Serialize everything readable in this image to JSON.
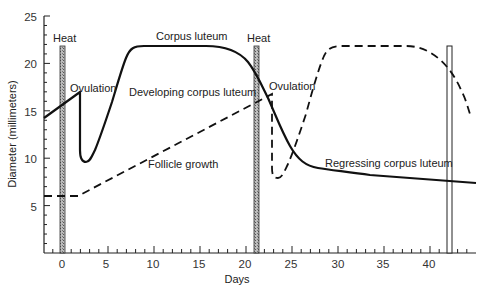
{
  "chart_data": {
    "type": "line",
    "title": "",
    "xlabel": "Days",
    "ylabel": "Diameter (millimeters)",
    "xlim": [
      -2,
      44.5
    ],
    "ylim": [
      0,
      25
    ],
    "x_ticks": [
      0,
      5,
      10,
      15,
      20,
      25,
      30,
      35,
      40
    ],
    "y_ticks": [
      5,
      10,
      15,
      20,
      25
    ],
    "grid": false,
    "series": [
      {
        "name": "Corpus luteum (developing / regressing)",
        "style": "solid",
        "points": [
          [
            -2,
            14.3
          ],
          [
            2,
            16.8
          ],
          [
            2,
            8
          ],
          [
            2.5,
            7.2
          ],
          [
            3.2,
            7.6
          ],
          [
            5,
            12
          ],
          [
            7.5,
            19
          ],
          [
            9,
            21.5
          ],
          [
            11,
            22
          ],
          [
            17,
            22
          ],
          [
            19,
            21
          ],
          [
            21,
            19.5
          ],
          [
            22,
            17.5
          ],
          [
            24,
            13.5
          ],
          [
            26,
            10
          ],
          [
            28,
            8.9
          ],
          [
            32,
            8.3
          ],
          [
            38,
            7.6
          ],
          [
            44,
            6.9
          ]
        ]
      },
      {
        "name": "Follicle growth",
        "style": "dashed",
        "points": [
          [
            -2,
            6
          ],
          [
            1.8,
            6
          ],
          [
            23,
            17
          ],
          [
            23,
            8
          ],
          [
            23.5,
            7.1
          ],
          [
            24.2,
            7.5
          ],
          [
            26,
            12
          ],
          [
            28,
            18.5
          ],
          [
            29.5,
            21.5
          ],
          [
            31,
            22
          ],
          [
            38,
            22
          ],
          [
            41,
            21
          ],
          [
            43,
            19
          ],
          [
            44,
            16.7
          ]
        ]
      }
    ],
    "heat_bars": [
      {
        "label": "Heat",
        "day": 0.3,
        "top": 22,
        "filled": true
      },
      {
        "label": "Heat",
        "day": 21.3,
        "top": 22,
        "filled": true
      },
      {
        "label": "",
        "day": 42.3,
        "top": 22,
        "filled": false
      }
    ],
    "annotations": [
      {
        "text": "Heat",
        "x": 0,
        "y": 22.8
      },
      {
        "text": "Ovulation",
        "x": 4.5,
        "y": 17.6
      },
      {
        "text": "Corpus luteum",
        "x": 14,
        "y": 22.8
      },
      {
        "text": "Developing corpus luteum",
        "x": 15,
        "y": 16.3
      },
      {
        "text": "Follicle growth",
        "x": 12,
        "y": 9.5
      },
      {
        "text": "Heat",
        "x": 21.5,
        "y": 22.8
      },
      {
        "text": "Ovulation",
        "x": 26.5,
        "y": 17.5
      },
      {
        "text": "Regressing corpus luteum",
        "x": 35,
        "y": 9.8
      }
    ]
  },
  "labels": {
    "heat1": "Heat",
    "heat2": "Heat",
    "ovulation1": "Ovulation",
    "ovulation2": "Ovulation",
    "corpus_luteum": "Corpus luteum",
    "developing": "Developing corpus luteum",
    "follicle": "Follicle growth",
    "regressing": "Regressing corpus luteum",
    "xlabel": "Days",
    "ylabel": "Diameter (millimeters)"
  },
  "ticks": {
    "x": [
      "0",
      "5",
      "10",
      "15",
      "20",
      "25",
      "30",
      "35",
      "40"
    ],
    "y": [
      "5",
      "10",
      "15",
      "20",
      "25"
    ]
  }
}
